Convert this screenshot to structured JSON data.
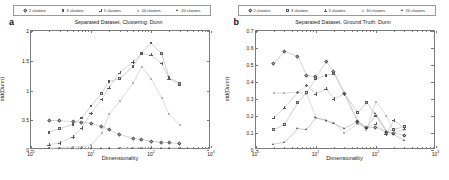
{
  "figure": {
    "panels": [
      {
        "letter": "a",
        "title": "Separated Dataset, Clustering: Dunn",
        "xlabel": "Dimensionality",
        "ylabel": "std(Dunn)",
        "yticks": [
          "0",
          "0.5",
          "1",
          "1.5",
          "2"
        ],
        "xticks": [
          "10",
          "10",
          "10",
          "10"
        ],
        "xexp": [
          "0",
          "1",
          "2",
          "3"
        ]
      },
      {
        "letter": "b",
        "title": "Separated Dataset, Ground Truth: Dunn",
        "xlabel": "Dimensionality",
        "ylabel": "std(Dunn)",
        "yticks": [
          "0",
          "0.1",
          "0.2",
          "0.3",
          "0.4",
          "0.5",
          "0.6",
          "0.7"
        ],
        "xticks": [
          "10",
          "10",
          "10",
          "10"
        ],
        "xexp": [
          "0",
          "1",
          "2",
          "3"
        ]
      }
    ],
    "legend": {
      "entries": [
        {
          "label": "2 clusters",
          "marker": "diamond"
        },
        {
          "label": "3 clusters",
          "marker": "square"
        },
        {
          "label": "5 clusters",
          "marker": "plus"
        },
        {
          "label": "10 clusters",
          "marker": "dot"
        },
        {
          "label": "20 clusters",
          "marker": "triangle"
        }
      ]
    }
  },
  "chart_data": [
    {
      "type": "scatter",
      "title": "Separated Dataset, Clustering: Dunn",
      "xlabel": "Dimensionality",
      "ylabel": "std(Dunn)",
      "xscale": "log",
      "xlim": [
        1,
        1000
      ],
      "ylim": [
        0,
        2
      ],
      "grid": false,
      "legend_position": "top",
      "x": [
        2,
        3,
        5,
        7,
        10,
        15,
        20,
        30,
        50,
        70,
        100,
        150,
        200,
        300
      ],
      "series": [
        {
          "name": "2 clusters",
          "marker": "diamond",
          "values": [
            0.5,
            0.49,
            0.48,
            0.47,
            0.45,
            0.4,
            0.34,
            0.26,
            0.2,
            0.17,
            0.15,
            0.13,
            0.12,
            0.11
          ]
        },
        {
          "name": "3 clusters",
          "marker": "square",
          "values": [
            0.3,
            0.36,
            0.43,
            0.54,
            0.74,
            0.95,
            1.15,
            1.2,
            1.4,
            1.63,
            1.8,
            1.62,
            1.22,
            1.12
          ]
        },
        {
          "name": "5 clusters",
          "marker": "plus",
          "values": [
            0.09,
            0.12,
            0.22,
            0.37,
            0.62,
            0.85,
            1.05,
            1.3,
            1.48,
            1.62,
            1.6,
            1.46,
            1.2,
            1.1
          ]
        },
        {
          "name": "10 clusters",
          "marker": "dot",
          "values": [
            0.03,
            0.04,
            0.05,
            0.06,
            0.08,
            0.28,
            0.6,
            0.82,
            1.12,
            1.4,
            1.2,
            0.88,
            0.6,
            0.42
          ]
        },
        {
          "name": "20 clusters",
          "marker": "triangle",
          "values": [
            0.02,
            0.02,
            0.02,
            0.02,
            0.02,
            0.02,
            0.02,
            0.03,
            0.03,
            0.03,
            0.03,
            0.03,
            0.03,
            0.03
          ]
        }
      ]
    },
    {
      "type": "scatter",
      "title": "Separated Dataset, Ground Truth: Dunn",
      "xlabel": "Dimensionality",
      "ylabel": "std(Dunn)",
      "xscale": "log",
      "xlim": [
        1,
        1000
      ],
      "ylim": [
        0,
        0.7
      ],
      "grid": false,
      "legend_position": "top",
      "x": [
        2,
        3,
        5,
        7,
        10,
        15,
        20,
        30,
        50,
        70,
        100,
        150,
        200,
        300
      ],
      "series": [
        {
          "name": "2 clusters",
          "marker": "diamond",
          "values": [
            0.51,
            0.58,
            0.55,
            0.44,
            0.43,
            0.52,
            0.46,
            0.33,
            0.17,
            0.13,
            0.135,
            0.105,
            0.1,
            0.085
          ]
        },
        {
          "name": "3 clusters",
          "marker": "square",
          "values": [
            0.12,
            0.15,
            0.28,
            0.34,
            0.42,
            0.44,
            0.45,
            0.33,
            0.22,
            0.28,
            0.2,
            0.105,
            0.12,
            0.14
          ]
        },
        {
          "name": "5 clusters",
          "marker": "plus",
          "values": [
            0.19,
            0.25,
            0.34,
            0.38,
            0.33,
            0.36,
            0.3,
            0.33,
            0.16,
            0.13,
            0.155,
            0.095,
            0.175,
            0.125
          ]
        },
        {
          "name": "10 clusters",
          "marker": "dot",
          "values": [
            0.335,
            0.335,
            0.34,
            0.33,
            0.19,
            0.17,
            0.16,
            0.1,
            0.155,
            0.12,
            0.285,
            0.2,
            0.105,
            0.12
          ]
        },
        {
          "name": "20 clusters",
          "marker": "triangle",
          "values": [
            0.035,
            0.045,
            0.125,
            0.12,
            0.19,
            0.175,
            0.155,
            0.125,
            0.17,
            0.125,
            0.215,
            0.11,
            0.09,
            0.055
          ]
        }
      ]
    }
  ]
}
